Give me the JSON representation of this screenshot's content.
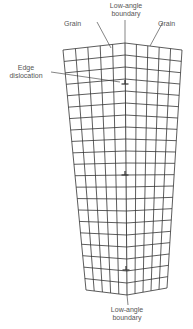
{
  "labels": {
    "grain_left": "Grain",
    "grain_right": "Grain",
    "boundary_top_line1": "Low-angle",
    "boundary_top_line2": "boundary",
    "edge_line1": "Edge",
    "edge_line2": "dislocation",
    "boundary_bottom_line1": "Low-angle",
    "boundary_bottom_line2": "boundary"
  },
  "grid": {
    "rows": 21,
    "left_columns": 5,
    "right_columns": 5,
    "top_left": [
      63,
      50
    ],
    "top_center": [
      125,
      43
    ],
    "top_right": [
      182,
      50
    ],
    "bottom_left": [
      86,
      290
    ],
    "bottom_center": [
      127,
      295
    ],
    "bottom_right": [
      167,
      288
    ],
    "line_color": "#333333"
  },
  "dislocations": [
    {
      "x": 125,
      "y": 84
    },
    {
      "x": 125,
      "y": 175
    },
    {
      "x": 126,
      "y": 270
    }
  ],
  "symbol": "⊥"
}
